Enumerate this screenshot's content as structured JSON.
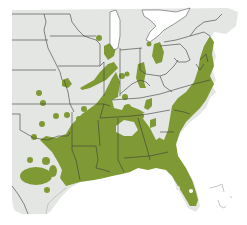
{
  "map": {
    "type": "species-range-map",
    "region": "Eastern United States",
    "colors": {
      "background": "#ffffff",
      "land": "#e4e6e4",
      "range": "#7f9a34",
      "border": "#3a3d3a",
      "water": "#ffffff"
    },
    "legend": null,
    "labels": []
  }
}
